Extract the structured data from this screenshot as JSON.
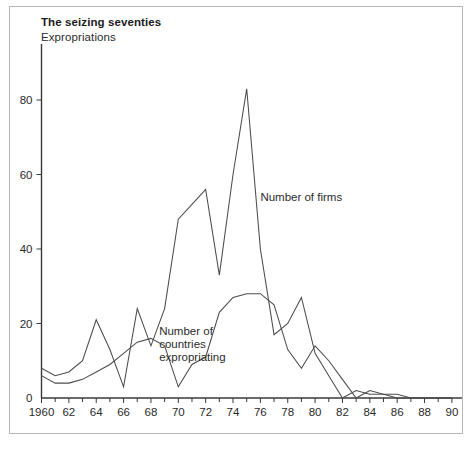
{
  "chart_data": {
    "type": "line",
    "title": "The seizing seventies",
    "subtitle": "Expropriations",
    "xlabel": "",
    "ylabel": "",
    "xlim": [
      1960,
      1990
    ],
    "ylim": [
      0,
      90
    ],
    "grid": false,
    "legend_position": "inline-annotations",
    "x": [
      1960,
      1961,
      1962,
      1963,
      1964,
      1965,
      1966,
      1967,
      1968,
      1969,
      1970,
      1971,
      1972,
      1973,
      1974,
      1975,
      1976,
      1977,
      1978,
      1979,
      1980,
      1981,
      1982,
      1983,
      1984,
      1985,
      1986,
      1987,
      1988,
      1989,
      1990
    ],
    "xticks": [
      1960,
      1962,
      1964,
      1966,
      1968,
      1970,
      1972,
      1974,
      1976,
      1978,
      1980,
      1982,
      1984,
      1986,
      1988,
      1990
    ],
    "xticklabels": [
      "1960",
      "62",
      "64",
      "66",
      "68",
      "70",
      "72",
      "74",
      "76",
      "78",
      "80",
      "82",
      "84",
      "86",
      "88",
      "90"
    ],
    "yticks": [
      0,
      20,
      40,
      60,
      80
    ],
    "yticklabels": [
      "0",
      "20",
      "40",
      "60",
      "80"
    ],
    "series": [
      {
        "name": "Number of firms",
        "label_text": "Number of firms",
        "color": "#4c4c4c",
        "values": [
          8,
          6,
          7,
          10,
          21,
          13,
          3,
          24,
          14,
          24,
          48,
          52,
          56,
          33,
          60,
          83,
          40,
          17,
          20,
          27,
          12,
          6,
          0,
          2,
          1,
          1,
          0,
          0,
          0,
          0,
          0
        ]
      },
      {
        "name": "Number of countries expropriating",
        "label_text_lines": [
          "Number of",
          "countries",
          "expropriating"
        ],
        "color": "#4c4c4c",
        "values": [
          6,
          4,
          4,
          5,
          7,
          9,
          12,
          15,
          16,
          14,
          3,
          9,
          11,
          23,
          27,
          28,
          28,
          25,
          13,
          8,
          14,
          10,
          5,
          0,
          2,
          1,
          1,
          0,
          0,
          0,
          0
        ]
      }
    ],
    "annotations": [
      {
        "text": "Number of firms",
        "x": 1976,
        "y": 53
      },
      {
        "text": "Number of countries expropriating",
        "x": 1968.6,
        "y": 17
      }
    ]
  },
  "axes": {
    "x_tick_labels": [
      "1960",
      "62",
      "64",
      "66",
      "68",
      "70",
      "72",
      "74",
      "76",
      "78",
      "80",
      "82",
      "84",
      "86",
      "88",
      "90"
    ],
    "y_tick_labels": [
      "0",
      "20",
      "40",
      "60",
      "80"
    ]
  },
  "labels": {
    "firms": "Number of firms",
    "countries_line1": "Number of",
    "countries_line2": "countries",
    "countries_line3": "expropriating"
  },
  "colors": {
    "line": "#4c4c4c",
    "axis": "#3a3a3a",
    "frame": "#b9b9b6",
    "text": "#2b2b2b",
    "title": "#1b1b1b",
    "background": "#ffffff"
  }
}
